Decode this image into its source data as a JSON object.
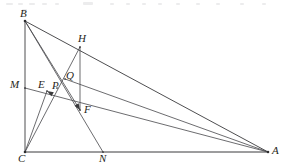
{
  "figure": {
    "kind": "euclidean-geometry-diagram",
    "width": 287,
    "height": 167,
    "background_color": "#ffffff",
    "line_color": "#3a3a3c",
    "label_color": "#1f1f21",
    "labels": {
      "A": "A",
      "B": "B",
      "C": "C",
      "E": "E",
      "F": "F",
      "H": "H",
      "M": "M",
      "N": "N",
      "P": "P",
      "Q": "Q"
    },
    "points": {
      "A": {
        "x": 268,
        "y": 152,
        "label_x": 272,
        "label_y": 145
      },
      "B": {
        "x": 25,
        "y": 21,
        "label_x": 20,
        "label_y": 8
      },
      "C": {
        "x": 25,
        "y": 152,
        "label_x": 18,
        "label_y": 153
      },
      "E": {
        "x": 47,
        "y": 91,
        "label_x": 38,
        "label_y": 79
      },
      "F": {
        "x": 80,
        "y": 110,
        "label_x": 84,
        "label_y": 104
      },
      "H": {
        "x": 80,
        "y": 47,
        "label_x": 78,
        "label_y": 33
      },
      "M": {
        "x": 25,
        "y": 88,
        "label_x": 10,
        "label_y": 79
      },
      "N": {
        "x": 103,
        "y": 152,
        "label_x": 99,
        "label_y": 153
      },
      "P": {
        "x": 57,
        "y": 88,
        "label_x": 52,
        "label_y": 80
      },
      "Q": {
        "x": 65,
        "y": 79,
        "label_x": 66,
        "label_y": 70
      }
    },
    "segments": [
      {
        "name": "segment-BC",
        "from": "B",
        "to": "C",
        "style": "plain"
      },
      {
        "name": "segment-CA",
        "from": "C",
        "to": "A",
        "style": "base"
      },
      {
        "name": "segment-BA",
        "from": "B",
        "to": "A",
        "style": "plain"
      },
      {
        "name": "segment-MA",
        "from": "M",
        "to": "A",
        "style": "thin"
      },
      {
        "name": "segment-CH",
        "from": "C",
        "to": "H",
        "style": "thin"
      },
      {
        "name": "segment-HF",
        "from": "H",
        "to": "F",
        "style": "thin"
      },
      {
        "name": "segment-BN",
        "from": "B",
        "to": "N",
        "style": "thin"
      },
      {
        "name": "segment-BF",
        "from": "B",
        "to": "F",
        "style": "thin"
      },
      {
        "name": "segment-QA",
        "from": "Q",
        "to": "A",
        "style": "thin"
      },
      {
        "name": "segment-CE",
        "from": "C",
        "to": "E",
        "style": "thin"
      }
    ],
    "arrows": [
      {
        "name": "arrow-to-F",
        "from": "B",
        "to": "F"
      },
      {
        "name": "arrow-to-E",
        "from": "F",
        "to": "E"
      }
    ]
  }
}
